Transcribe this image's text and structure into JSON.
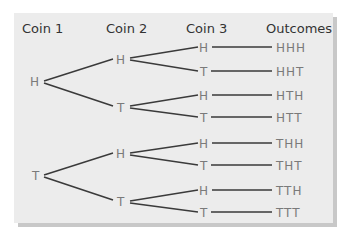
{
  "headers": {
    "coin1": "Coin 1",
    "coin2": "Coin 2",
    "coin3": "Coin 3",
    "outcomes": "Outcomes"
  },
  "coin1": [
    "H",
    "T"
  ],
  "coin2": [
    "H",
    "T",
    "H",
    "T"
  ],
  "coin3": [
    "H",
    "T",
    "H",
    "T",
    "H",
    "T",
    "H",
    "T"
  ],
  "outcomes": [
    "HHH",
    "HHT",
    "HTH",
    "HTT",
    "THH",
    "THT",
    "TTH",
    "TTT"
  ],
  "colors": {
    "panel": "#ececec",
    "shadow": "#c8c8c8",
    "line": "#3a3a3a",
    "text": "#7a7a7a",
    "header": "#333333"
  }
}
